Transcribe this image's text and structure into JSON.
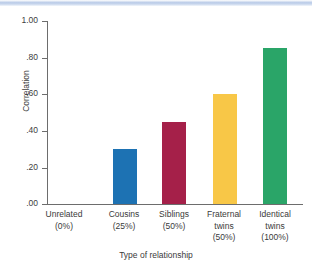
{
  "chart_data": {
    "type": "bar",
    "title": "",
    "xlabel": "Type of relationship",
    "ylabel": "Correlation",
    "categories": [
      "Unrelated",
      "Cousins",
      "Siblings",
      "Fraternal twins",
      "Identical twins"
    ],
    "category_lines": [
      [
        "Unrelated",
        "(0%)"
      ],
      [
        "Cousins",
        "(25%)"
      ],
      [
        "Siblings",
        "(50%)"
      ],
      [
        "Fraternal",
        "twins",
        "(50%)"
      ],
      [
        "Identical",
        "twins",
        "(100%)"
      ]
    ],
    "values": [
      0.0,
      0.3,
      0.45,
      0.6,
      0.85
    ],
    "bar_colors": [
      "#ffffff",
      "#1d72b3",
      "#a52049",
      "#f8c747",
      "#2aa568"
    ],
    "ylim": [
      0.0,
      1.0
    ],
    "yticks": [
      0.0,
      0.2,
      0.4,
      0.6,
      0.8,
      1.0
    ],
    "ytick_labels": [
      ".00",
      ".20",
      ".40",
      ".60",
      ".80",
      "1.00"
    ],
    "grid": false,
    "legend": "none"
  },
  "axes": {
    "y_label": "Correlation",
    "x_label": "Type of relationship",
    "y_ticks": [
      {
        "label": "1.00",
        "value": 1.0
      },
      {
        "label": ".80",
        "value": 0.8
      },
      {
        "label": ".60",
        "value": 0.6
      },
      {
        "label": ".40",
        "value": 0.4
      },
      {
        "label": ".20",
        "value": 0.2
      },
      {
        "label": ".00",
        "value": 0.0
      }
    ]
  },
  "bars": [
    {
      "name": "Unrelated",
      "line1": "Unrelated",
      "line2": "(0%)",
      "line3": "",
      "value": 0.0,
      "color": "#ffffff"
    },
    {
      "name": "Cousins",
      "line1": "Cousins",
      "line2": "(25%)",
      "line3": "",
      "value": 0.3,
      "color": "#1d72b3"
    },
    {
      "name": "Siblings",
      "line1": "Siblings",
      "line2": "(50%)",
      "line3": "",
      "value": 0.45,
      "color": "#a52049"
    },
    {
      "name": "Fraternal twins",
      "line1": "Fraternal",
      "line2": "twins",
      "line3": "(50%)",
      "value": 0.6,
      "color": "#f8c747"
    },
    {
      "name": "Identical twins",
      "line1": "Identical",
      "line2": "twins",
      "line3": "(100%)",
      "value": 0.85,
      "color": "#2aa568"
    }
  ],
  "colors": {
    "axis": "#6d6d6d",
    "text": "#3a3a3a",
    "band": "#b9cbe8"
  }
}
